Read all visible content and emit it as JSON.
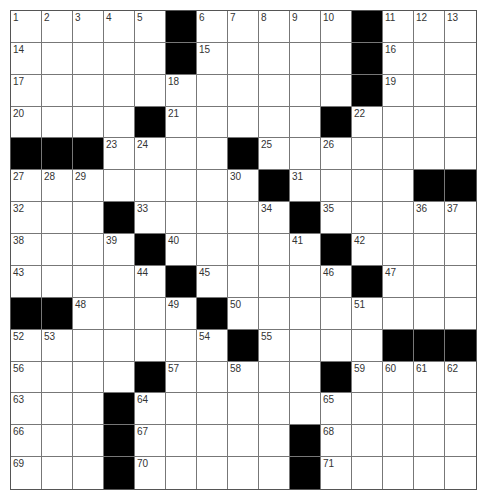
{
  "puzzle": {
    "rows": 15,
    "cols": 15,
    "grid": [
      "111110111110111",
      "111110111110111",
      "111111111110111",
      "111101111101111",
      "000111101111111",
      "111111110111100",
      "111011111011111",
      "111101111101111",
      "111110111110111",
      "001111011111111",
      "111111101111000",
      "111101111101111",
      "111011111111111",
      "111011111011111",
      "111011111011111"
    ],
    "numbers": [
      {
        "r": 0,
        "c": 0,
        "n": "1"
      },
      {
        "r": 0,
        "c": 1,
        "n": "2"
      },
      {
        "r": 0,
        "c": 2,
        "n": "3"
      },
      {
        "r": 0,
        "c": 3,
        "n": "4"
      },
      {
        "r": 0,
        "c": 4,
        "n": "5"
      },
      {
        "r": 0,
        "c": 6,
        "n": "6"
      },
      {
        "r": 0,
        "c": 7,
        "n": "7"
      },
      {
        "r": 0,
        "c": 8,
        "n": "8"
      },
      {
        "r": 0,
        "c": 9,
        "n": "9"
      },
      {
        "r": 0,
        "c": 10,
        "n": "10"
      },
      {
        "r": 0,
        "c": 12,
        "n": "11"
      },
      {
        "r": 0,
        "c": 13,
        "n": "12"
      },
      {
        "r": 0,
        "c": 14,
        "n": "13"
      },
      {
        "r": 1,
        "c": 0,
        "n": "14"
      },
      {
        "r": 1,
        "c": 6,
        "n": "15"
      },
      {
        "r": 1,
        "c": 12,
        "n": "16"
      },
      {
        "r": 2,
        "c": 0,
        "n": "17"
      },
      {
        "r": 2,
        "c": 5,
        "n": "18"
      },
      {
        "r": 2,
        "c": 12,
        "n": "19"
      },
      {
        "r": 3,
        "c": 0,
        "n": "20"
      },
      {
        "r": 3,
        "c": 5,
        "n": "21"
      },
      {
        "r": 3,
        "c": 11,
        "n": "22"
      },
      {
        "r": 4,
        "c": 3,
        "n": "23"
      },
      {
        "r": 4,
        "c": 4,
        "n": "24"
      },
      {
        "r": 4,
        "c": 8,
        "n": "25"
      },
      {
        "r": 4,
        "c": 10,
        "n": "26"
      },
      {
        "r": 5,
        "c": 0,
        "n": "27"
      },
      {
        "r": 5,
        "c": 1,
        "n": "28"
      },
      {
        "r": 5,
        "c": 2,
        "n": "29"
      },
      {
        "r": 5,
        "c": 7,
        "n": "30"
      },
      {
        "r": 5,
        "c": 9,
        "n": "31"
      },
      {
        "r": 6,
        "c": 0,
        "n": "32"
      },
      {
        "r": 6,
        "c": 4,
        "n": "33"
      },
      {
        "r": 6,
        "c": 8,
        "n": "34"
      },
      {
        "r": 6,
        "c": 10,
        "n": "35"
      },
      {
        "r": 6,
        "c": 13,
        "n": "36"
      },
      {
        "r": 6,
        "c": 14,
        "n": "37"
      },
      {
        "r": 7,
        "c": 0,
        "n": "38"
      },
      {
        "r": 7,
        "c": 3,
        "n": "39"
      },
      {
        "r": 7,
        "c": 5,
        "n": "40"
      },
      {
        "r": 7,
        "c": 9,
        "n": "41"
      },
      {
        "r": 7,
        "c": 11,
        "n": "42"
      },
      {
        "r": 8,
        "c": 0,
        "n": "43"
      },
      {
        "r": 8,
        "c": 4,
        "n": "44"
      },
      {
        "r": 8,
        "c": 6,
        "n": "45"
      },
      {
        "r": 8,
        "c": 10,
        "n": "46"
      },
      {
        "r": 8,
        "c": 12,
        "n": "47"
      },
      {
        "r": 9,
        "c": 2,
        "n": "48"
      },
      {
        "r": 9,
        "c": 5,
        "n": "49"
      },
      {
        "r": 9,
        "c": 7,
        "n": "50"
      },
      {
        "r": 9,
        "c": 11,
        "n": "51"
      },
      {
        "r": 10,
        "c": 0,
        "n": "52"
      },
      {
        "r": 10,
        "c": 1,
        "n": "53"
      },
      {
        "r": 10,
        "c": 6,
        "n": "54"
      },
      {
        "r": 10,
        "c": 8,
        "n": "55"
      },
      {
        "r": 11,
        "c": 0,
        "n": "56"
      },
      {
        "r": 11,
        "c": 5,
        "n": "57"
      },
      {
        "r": 11,
        "c": 7,
        "n": "58"
      },
      {
        "r": 11,
        "c": 11,
        "n": "59"
      },
      {
        "r": 11,
        "c": 12,
        "n": "60"
      },
      {
        "r": 11,
        "c": 13,
        "n": "61"
      },
      {
        "r": 11,
        "c": 14,
        "n": "62"
      },
      {
        "r": 12,
        "c": 0,
        "n": "63"
      },
      {
        "r": 12,
        "c": 4,
        "n": "64"
      },
      {
        "r": 12,
        "c": 10,
        "n": "65"
      },
      {
        "r": 13,
        "c": 0,
        "n": "66"
      },
      {
        "r": 13,
        "c": 4,
        "n": "67"
      },
      {
        "r": 13,
        "c": 10,
        "n": "68"
      },
      {
        "r": 14,
        "c": 0,
        "n": "69"
      },
      {
        "r": 14,
        "c": 4,
        "n": "70"
      },
      {
        "r": 14,
        "c": 10,
        "n": "71"
      }
    ],
    "colors": {
      "black_cell": "#000000",
      "white_cell": "#ffffff",
      "grid_line": "#777777"
    }
  }
}
